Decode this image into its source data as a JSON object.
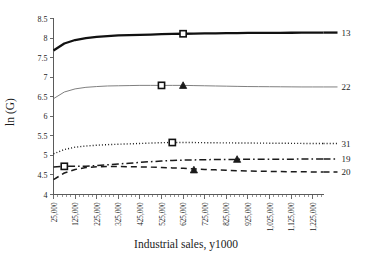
{
  "chart_data": {
    "type": "line",
    "title": "",
    "xlabel": "Industrial sales, y1000",
    "ylabel": "ln (G)",
    "xlim": [
      25000,
      1275000
    ],
    "ylim": [
      4,
      8.5
    ],
    "grid": false,
    "legend_position": "right-of-plot-inline",
    "y_ticks": [
      "4",
      "4.5",
      "5",
      "5.5",
      "6",
      "6.5",
      "7",
      "7.5",
      "8",
      "8.5"
    ],
    "y_tick_values": [
      4,
      4.5,
      5,
      5.5,
      6,
      6.5,
      7,
      7.5,
      8,
      8.5
    ],
    "x_ticks": [
      "25,000",
      "125,000",
      "225,000",
      "325,000",
      "425,000",
      "525,000",
      "625,000",
      "725,000",
      "825,000",
      "925,000",
      "1,025,000",
      "1,125,000",
      "1,225,000"
    ],
    "x_tick_values": [
      25000,
      125000,
      225000,
      325000,
      425000,
      525000,
      625000,
      725000,
      825000,
      925000,
      1025000,
      1125000,
      1225000
    ],
    "x": [
      25000,
      75000,
      125000,
      175000,
      225000,
      275000,
      325000,
      375000,
      425000,
      475000,
      525000,
      575000,
      625000,
      675000,
      725000,
      775000,
      825000,
      875000,
      925000,
      975000,
      1025000,
      1075000,
      1125000,
      1175000,
      1225000,
      1275000
    ],
    "series": [
      {
        "name": "13",
        "label": "13",
        "style": "solid-thick",
        "color": "#111111",
        "width": 2.3,
        "marker": "square",
        "marker_x": 625000,
        "marker_y": 8.11,
        "values": [
          7.68,
          7.86,
          7.95,
          8.0,
          8.03,
          8.05,
          8.07,
          8.075,
          8.08,
          8.09,
          8.1,
          8.105,
          8.11,
          8.115,
          8.12,
          8.122,
          8.125,
          8.127,
          8.13,
          8.132,
          8.134,
          8.135,
          8.136,
          8.137,
          8.138,
          8.14
        ]
      },
      {
        "name": "22",
        "label": "22",
        "style": "solid-thin",
        "color": "#808080",
        "width": 1,
        "marker": "square",
        "marker_x": 525000,
        "marker_y": 6.79,
        "marker2": "triangle",
        "marker2_x": 625000,
        "marker2_y": 6.79,
        "values": [
          6.45,
          6.62,
          6.7,
          6.74,
          6.76,
          6.775,
          6.78,
          6.785,
          6.79,
          6.79,
          6.79,
          6.79,
          6.79,
          6.785,
          6.78,
          6.775,
          6.77,
          6.765,
          6.76,
          6.758,
          6.756,
          6.754,
          6.752,
          6.75,
          6.75,
          6.75
        ]
      },
      {
        "name": "31",
        "label": "31",
        "style": "dotted",
        "color": "#1a1a1a",
        "width": 1.4,
        "marker": "square",
        "marker_x": 575000,
        "marker_y": 5.33,
        "values": [
          5.04,
          5.15,
          5.21,
          5.24,
          5.26,
          5.275,
          5.285,
          5.295,
          5.305,
          5.315,
          5.325,
          5.33,
          5.33,
          5.328,
          5.325,
          5.322,
          5.32,
          5.318,
          5.316,
          5.314,
          5.312,
          5.31,
          5.308,
          5.306,
          5.305,
          5.305
        ]
      },
      {
        "name": "19",
        "label": "19",
        "style": "dash-dot",
        "color": "#1a1a1a",
        "width": 1.5,
        "marker": "square",
        "marker_x": 75000,
        "marker_y": 4.72,
        "marker2": "triangle",
        "marker2_x": 875000,
        "marker2_y": 4.9,
        "values": [
          4.7,
          4.72,
          4.72,
          4.725,
          4.74,
          4.76,
          4.78,
          4.8,
          4.82,
          4.84,
          4.855,
          4.87,
          4.88,
          4.885,
          4.89,
          4.893,
          4.895,
          4.898,
          4.9,
          4.9,
          4.902,
          4.903,
          4.904,
          4.905,
          4.905,
          4.905
        ]
      },
      {
        "name": "20",
        "label": "20",
        "style": "dashed",
        "color": "#1a1a1a",
        "width": 1.5,
        "marker": "triangle",
        "marker_x": 675000,
        "marker_y": 4.63,
        "values": [
          4.38,
          4.55,
          4.64,
          4.69,
          4.71,
          4.715,
          4.715,
          4.71,
          4.705,
          4.7,
          4.69,
          4.68,
          4.67,
          4.655,
          4.64,
          4.63,
          4.62,
          4.61,
          4.6,
          4.595,
          4.59,
          4.585,
          4.583,
          4.58,
          4.578,
          4.575
        ]
      }
    ]
  }
}
